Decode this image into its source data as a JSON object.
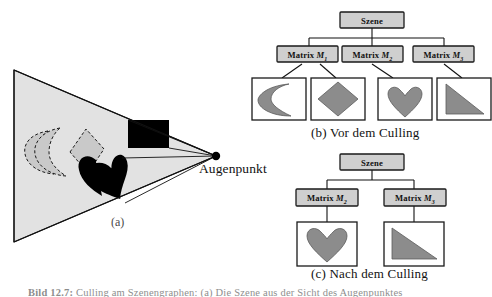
{
  "figure": {
    "kind": "textbook-illustration",
    "topic": "View frustum culling / Szenengraph",
    "bottom_caption_prefix": "Bild 12.7:",
    "bottom_caption_rest": "  Culling am Szenengraphen: (a) Die Szene aus der Sicht des Augenpunktes"
  },
  "colors": {
    "frustum_fill": "#e2e2e2",
    "shape_grey": "#9a9a9a",
    "node_fill": "#cfcfcf",
    "node_border": "#1a1a1a",
    "culled_grey": "#c9c9c9",
    "ink": "#111111",
    "white": "#ffffff"
  },
  "panel_a": {
    "caption": "(a)",
    "eye_label": "Augenpunkt",
    "visible_shapes": [
      "heart",
      "triangle"
    ],
    "culled_shapes": [
      "crescent",
      "diamond"
    ],
    "frustum_shape": "triangle-view-frustum"
  },
  "panel_b": {
    "caption": "(b) Vor dem Culling",
    "root": {
      "label": "Szene"
    },
    "matrices": [
      {
        "prefix": "Matrix",
        "symbol": "M",
        "index": "1"
      },
      {
        "prefix": "Matrix",
        "symbol": "M",
        "index": "2"
      },
      {
        "prefix": "Matrix",
        "symbol": "M",
        "index": "3"
      }
    ],
    "leaves": [
      {
        "shape": "crescent",
        "parent": "M1"
      },
      {
        "shape": "diamond",
        "parent": "M1"
      },
      {
        "shape": "heart",
        "parent": "M2"
      },
      {
        "shape": "triangle",
        "parent": "M3"
      }
    ]
  },
  "panel_c": {
    "caption": "(c) Nach dem Culling",
    "root": {
      "label": "Szene"
    },
    "matrices": [
      {
        "prefix": "Matrix",
        "symbol": "M",
        "index": "2"
      },
      {
        "prefix": "Matrix",
        "symbol": "M",
        "index": "3"
      }
    ],
    "leaves": [
      {
        "shape": "heart",
        "parent": "M2"
      },
      {
        "shape": "triangle",
        "parent": "M3"
      }
    ]
  }
}
